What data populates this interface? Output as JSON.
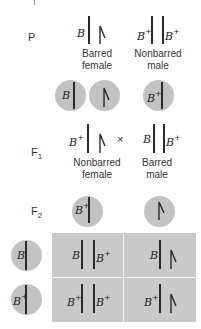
{
  "generations": {
    "p": "P",
    "f1": "F",
    "f1_sub": "1",
    "f2": "F",
    "f2_sub": "2"
  },
  "alleles": {
    "barred": "B",
    "nonbarred": "B",
    "plus": "+"
  },
  "parental": {
    "female": {
      "genotype": [
        "B",
        "W"
      ],
      "caption_line1": "Barred",
      "caption_line2": "female"
    },
    "male": {
      "genotype": [
        "B+",
        "B+"
      ],
      "caption_line1": "Nonbarred",
      "caption_line2": "male"
    },
    "female_gametes": [
      "B",
      "W"
    ],
    "male_gametes": [
      "B+"
    ]
  },
  "f1": {
    "female": {
      "genotype": [
        "B+",
        "W"
      ],
      "caption_line1": "Nonbarred",
      "caption_line2": "female"
    },
    "cross_symbol": "×",
    "male": {
      "genotype": [
        "B",
        "B+"
      ],
      "caption_line1": "Barred",
      "caption_line2": "male"
    }
  },
  "f2": {
    "column_gametes": [
      "B+",
      "W"
    ],
    "row_gametes": [
      "B",
      "B+"
    ],
    "punnett": [
      [
        {
          "left": "B",
          "right": "B+"
        },
        {
          "left": "B",
          "right": "W"
        }
      ],
      [
        {
          "left": "B+",
          "right": "B+"
        },
        {
          "left": "B+",
          "right": "W"
        }
      ]
    ]
  },
  "colors": {
    "circle_fill": "#c2c2c2",
    "grid_fill": "#c9c9c9",
    "grid_divider": "#f2f2f2",
    "chromosome": "#2a2a2a"
  }
}
